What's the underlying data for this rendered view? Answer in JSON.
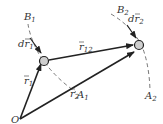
{
  "diagram": {
    "type": "two-particle position vectors",
    "origin_label": "O",
    "particles": [
      {
        "id": 1,
        "label": "m1"
      },
      {
        "id": 2,
        "label": "m2"
      }
    ],
    "vectors": [
      {
        "name": "r1",
        "label": "r",
        "sub": "1",
        "from": "O",
        "to": "m1"
      },
      {
        "name": "r2",
        "label": "r",
        "sub": "2",
        "from": "O",
        "to": "m2"
      },
      {
        "name": "r12",
        "label": "r",
        "sub": "12",
        "from": "m1",
        "to": "m2"
      },
      {
        "name": "dr1",
        "label": "dr",
        "sub": "1",
        "at": "m1"
      },
      {
        "name": "dr2",
        "label": "dr",
        "sub": "2",
        "at": "m2"
      }
    ],
    "paths": [
      {
        "name": "path1",
        "start": "B",
        "start_sub": "1",
        "end": "A",
        "end_sub": "1"
      },
      {
        "name": "path2",
        "start": "B",
        "start_sub": "2",
        "end": "A",
        "end_sub": "2"
      }
    ]
  }
}
